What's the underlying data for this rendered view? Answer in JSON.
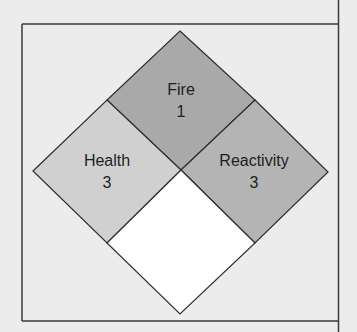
{
  "diagram": {
    "type": "NFPA 704 hazard diamond",
    "colors": {
      "background": "#ececec",
      "frame": "#3a3a3a",
      "fire": "#a9a9a9",
      "health": "#d0d0d0",
      "reactivity": "#b4b4b4",
      "special": "#ffffff",
      "outline": "#2e2e2e"
    },
    "sections": {
      "fire": {
        "label": "Fire",
        "value": "1"
      },
      "health": {
        "label": "Health",
        "value": "3"
      },
      "reactivity": {
        "label": "Reactivity",
        "value": "3"
      },
      "special": {
        "label": "",
        "value": ""
      }
    }
  }
}
